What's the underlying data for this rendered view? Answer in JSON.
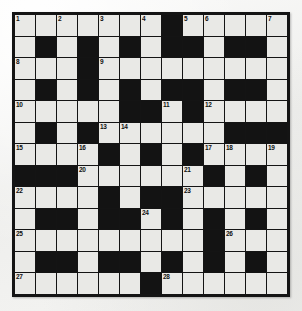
{
  "puzzle": {
    "type": "crossword-grid",
    "rows": 13,
    "cols": 13,
    "colors": {
      "block": "#131313",
      "open": "#e9e9e6",
      "border": "#141414",
      "page_background": "#f2f2f0",
      "number_text": "#101010"
    },
    "grid": [
      [
        "open",
        "open",
        "open",
        "open",
        "open",
        "open",
        "open",
        "block",
        "open",
        "open",
        "open",
        "open",
        "open"
      ],
      [
        "open",
        "block",
        "open",
        "block",
        "open",
        "block",
        "open",
        "block",
        "block",
        "open",
        "block",
        "block",
        "open"
      ],
      [
        "open",
        "open",
        "open",
        "block",
        "open",
        "open",
        "open",
        "open",
        "open",
        "open",
        "open",
        "open",
        "open"
      ],
      [
        "open",
        "block",
        "open",
        "block",
        "open",
        "block",
        "open",
        "block",
        "block",
        "open",
        "block",
        "block",
        "open"
      ],
      [
        "open",
        "open",
        "open",
        "open",
        "open",
        "block",
        "block",
        "open",
        "block",
        "open",
        "open",
        "open",
        "open"
      ],
      [
        "open",
        "block",
        "open",
        "block",
        "open",
        "open",
        "open",
        "open",
        "open",
        "open",
        "block",
        "block",
        "block"
      ],
      [
        "open",
        "open",
        "open",
        "open",
        "block",
        "open",
        "block",
        "open",
        "block",
        "open",
        "open",
        "open",
        "open"
      ],
      [
        "block",
        "block",
        "block",
        "open",
        "open",
        "open",
        "open",
        "open",
        "open",
        "block",
        "open",
        "block",
        "open"
      ],
      [
        "open",
        "open",
        "open",
        "open",
        "block",
        "open",
        "block",
        "block",
        "open",
        "open",
        "open",
        "open",
        "open"
      ],
      [
        "open",
        "block",
        "block",
        "open",
        "block",
        "block",
        "open",
        "block",
        "open",
        "block",
        "open",
        "block",
        "open"
      ],
      [
        "open",
        "open",
        "open",
        "open",
        "open",
        "open",
        "open",
        "open",
        "open",
        "block",
        "open",
        "open",
        "open"
      ],
      [
        "open",
        "block",
        "block",
        "open",
        "block",
        "block",
        "open",
        "block",
        "open",
        "block",
        "open",
        "block",
        "open"
      ],
      [
        "open",
        "open",
        "open",
        "open",
        "open",
        "open",
        "block",
        "open",
        "open",
        "open",
        "open",
        "open",
        "open"
      ]
    ],
    "numbers": [
      {
        "n": 1,
        "row": 1,
        "col": 1
      },
      {
        "n": 2,
        "row": 1,
        "col": 3
      },
      {
        "n": 3,
        "row": 1,
        "col": 5
      },
      {
        "n": 4,
        "row": 1,
        "col": 7
      },
      {
        "n": 5,
        "row": 1,
        "col": 9
      },
      {
        "n": 6,
        "row": 1,
        "col": 10
      },
      {
        "n": 7,
        "row": 1,
        "col": 13
      },
      {
        "n": 8,
        "row": 3,
        "col": 1
      },
      {
        "n": 9,
        "row": 3,
        "col": 5
      },
      {
        "n": 10,
        "row": 5,
        "col": 1
      },
      {
        "n": 11,
        "row": 5,
        "col": 8
      },
      {
        "n": 12,
        "row": 5,
        "col": 10
      },
      {
        "n": 13,
        "row": 6,
        "col": 5
      },
      {
        "n": 14,
        "row": 6,
        "col": 6
      },
      {
        "n": 15,
        "row": 7,
        "col": 1
      },
      {
        "n": 16,
        "row": 7,
        "col": 4
      },
      {
        "n": 17,
        "row": 7,
        "col": 10
      },
      {
        "n": 18,
        "row": 7,
        "col": 11
      },
      {
        "n": 19,
        "row": 7,
        "col": 13
      },
      {
        "n": 20,
        "row": 8,
        "col": 4
      },
      {
        "n": 21,
        "row": 8,
        "col": 9
      },
      {
        "n": 22,
        "row": 9,
        "col": 1
      },
      {
        "n": 23,
        "row": 9,
        "col": 9
      },
      {
        "n": 24,
        "row": 10,
        "col": 7
      },
      {
        "n": 25,
        "row": 11,
        "col": 1
      },
      {
        "n": 26,
        "row": 11,
        "col": 11
      },
      {
        "n": 27,
        "row": 13,
        "col": 1
      },
      {
        "n": 28,
        "row": 13,
        "col": 8
      }
    ]
  }
}
